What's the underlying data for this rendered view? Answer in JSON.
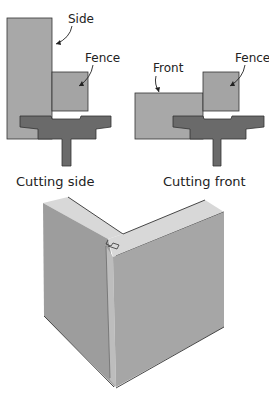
{
  "figure": {
    "panel_left": {
      "caption": "Cutting side",
      "labels": {
        "side": "Side",
        "fence": "Fence"
      }
    },
    "panel_right": {
      "caption": "Cutting front",
      "labels": {
        "front": "Front",
        "fence": "Fence"
      }
    },
    "panel_bottom": {
      "description": "Assembled drawer corner joint (isometric view)"
    }
  },
  "colors": {
    "light_gray": "#a8a8a8",
    "mid_gray": "#9b9b9b",
    "dark_gray": "#6a6a6a",
    "outline": "#333333",
    "top_face": "#d8d8d8"
  }
}
